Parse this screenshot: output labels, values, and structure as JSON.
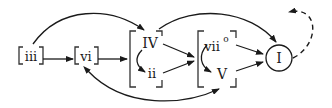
{
  "diagram": {
    "type": "harmonic-progression-flowchart",
    "nodes": {
      "iii": {
        "label": "iii"
      },
      "vi": {
        "label": "vi"
      },
      "IV": {
        "label": "IV"
      },
      "ii": {
        "label": "ii"
      },
      "vii": {
        "label": "vii",
        "superscript": "o"
      },
      "V": {
        "label": "V"
      },
      "I": {
        "label": "I"
      }
    },
    "groups": [
      {
        "name": "predominant",
        "members": [
          "IV",
          "ii"
        ]
      },
      {
        "name": "dominant",
        "members": [
          "vii",
          "V"
        ]
      }
    ],
    "edges": [
      {
        "from": "iii",
        "to": "vi",
        "style": "solid"
      },
      {
        "from": "iii",
        "to": "IV",
        "style": "solid-curved"
      },
      {
        "from": "vi",
        "to": "predominant",
        "style": "solid"
      },
      {
        "from": "IV",
        "to": "ii",
        "style": "solid-curved"
      },
      {
        "from": "IV",
        "to": "dominant",
        "style": "solid"
      },
      {
        "from": "ii",
        "to": "dominant",
        "style": "solid"
      },
      {
        "from": "IV",
        "to": "I",
        "style": "solid-curved"
      },
      {
        "from": "vii",
        "to": "V",
        "style": "solid-curved"
      },
      {
        "from": "vii",
        "to": "I",
        "style": "solid"
      },
      {
        "from": "V",
        "to": "I",
        "style": "solid"
      },
      {
        "from": "V",
        "to": "vi",
        "style": "solid-curved-bidirectional"
      },
      {
        "from": "I",
        "to": "any",
        "style": "dashed-loop"
      }
    ],
    "colors": {
      "ink": "#1a1a1a",
      "background": "#ffffff"
    }
  }
}
